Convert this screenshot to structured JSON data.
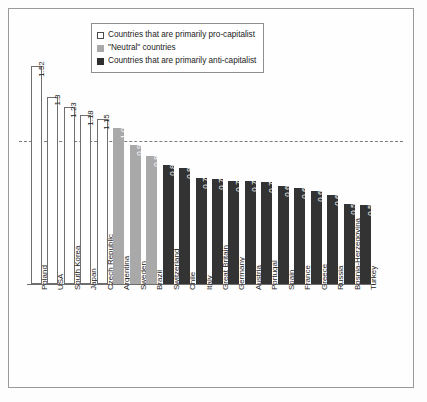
{
  "chart_data": {
    "type": "bar",
    "title": "",
    "subtitle": "",
    "xlabel": "",
    "ylabel": "",
    "ylim": [
      0,
      1.6
    ],
    "grid": false,
    "legend_position": "top-center",
    "reference_line": {
      "value": 1.0,
      "style": "dashed"
    },
    "legend": [
      {
        "key": "pro",
        "label": "Countries that are primarily pro-capitalist",
        "swatch": "white"
      },
      {
        "key": "neutral",
        "label": "\"Neutral\" countries",
        "swatch": "gray"
      },
      {
        "key": "anti",
        "label": "Countries that are primarily anti-capitalist",
        "swatch": "dark"
      }
    ],
    "categories": [
      "Poland",
      "USA",
      "South Korea",
      "Japan",
      "Czech Republic",
      "Argentina",
      "Sweden",
      "Brazil",
      "Switzerland",
      "Chile",
      "Italy",
      "Great Britain",
      "Germany",
      "Austria",
      "Portugal",
      "Spain",
      "France",
      "Greece",
      "Russia",
      "Bosnia-Herzegovina",
      "Turkey"
    ],
    "values": [
      1.52,
      1.3,
      1.23,
      1.18,
      1.15,
      1.09,
      0.97,
      0.89,
      0.83,
      0.81,
      0.74,
      0.73,
      0.72,
      0.72,
      0.71,
      0.68,
      0.67,
      0.65,
      0.62,
      0.56,
      0.55
    ],
    "value_labels": [
      "1.52",
      "1.3",
      "1.23",
      "1.18",
      "1.15",
      "1.09",
      "0.97",
      "0.89",
      "0.83",
      "0.81",
      "0.74",
      "0.73",
      "0.72",
      "0.72",
      "0.71",
      "0.68",
      "0.67",
      "0.65",
      "0.62",
      "0.56",
      "0.55"
    ],
    "groups": [
      "pro",
      "pro",
      "pro",
      "pro",
      "pro",
      "neutral",
      "neutral",
      "neutral",
      "anti",
      "anti",
      "anti",
      "anti",
      "anti",
      "anti",
      "anti",
      "anti",
      "anti",
      "anti",
      "anti",
      "anti",
      "anti"
    ],
    "colors": {
      "pro": "#ffffff",
      "neutral": "#a9a9a9",
      "anti": "#333333",
      "bar_outline": "#6f6f6f",
      "frame": "#9a9a9a",
      "axis": "#6e6e6e",
      "refline": "#7d7d7d",
      "text": "#1a1a1a"
    }
  }
}
